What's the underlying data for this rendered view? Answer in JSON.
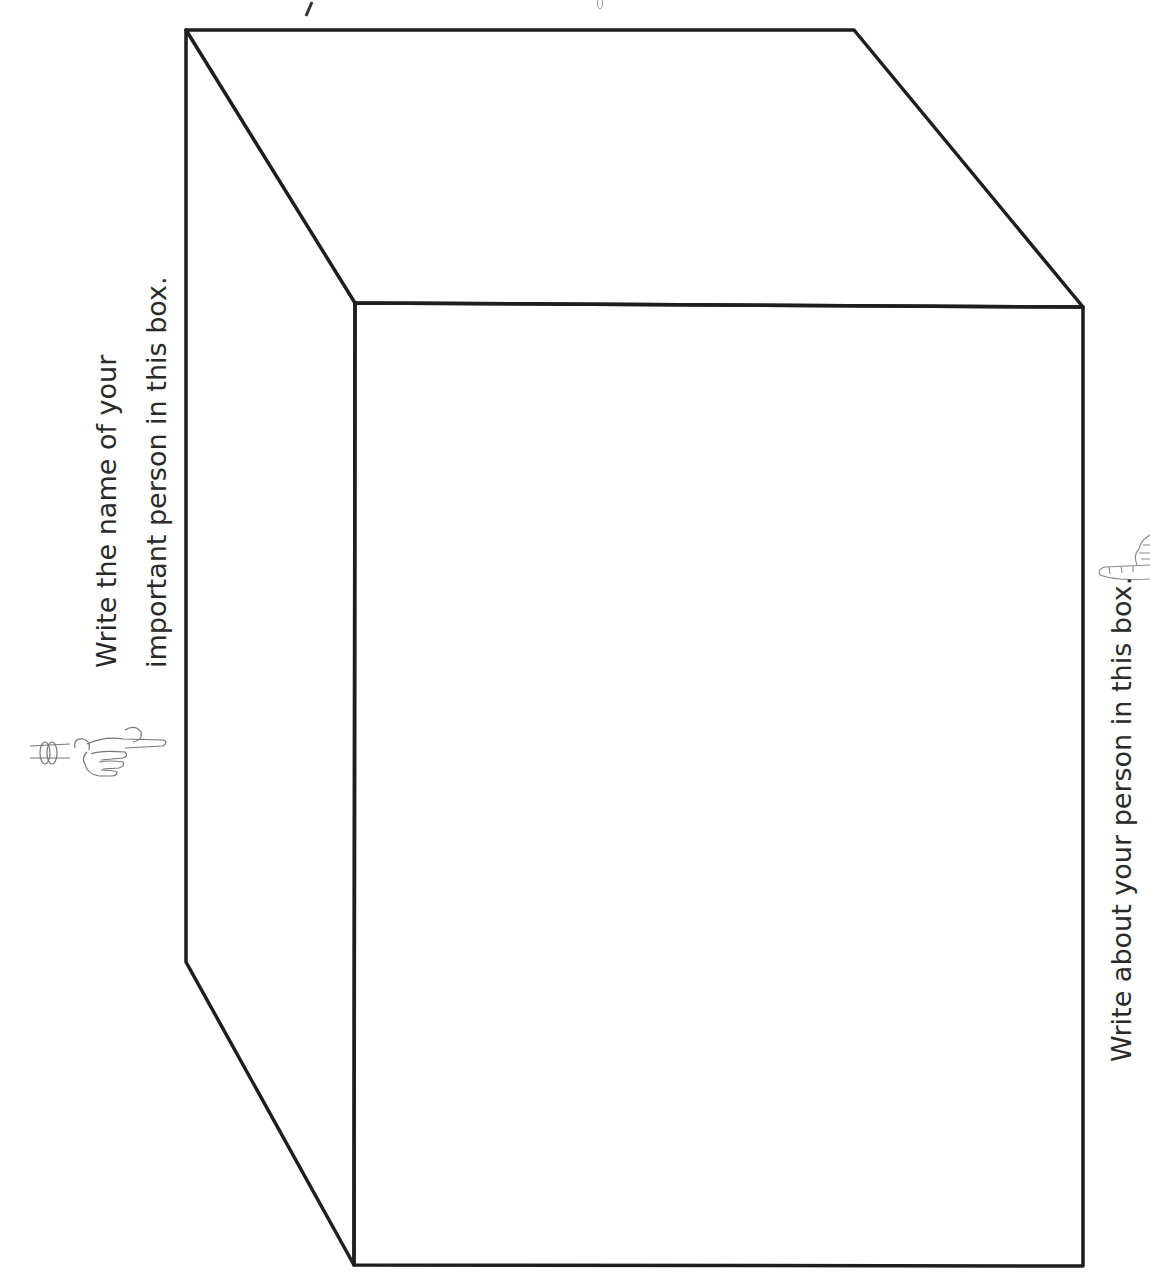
{
  "worksheet": {
    "name_prompt": {
      "line1": "Write the name of your",
      "line2": "important person in this box."
    },
    "about_prompt": "Write about your person in this box.",
    "icons": {
      "left_pointer": "pointing-hand-icon",
      "right_pointer": "pointing-hand-icon"
    },
    "colors": {
      "line": "#1e1e1e",
      "text": "#2a2a2a",
      "background": "#ffffff"
    }
  }
}
